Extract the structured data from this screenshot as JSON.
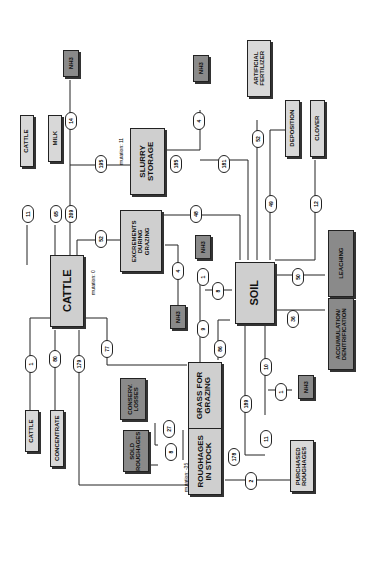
{
  "nodes": {
    "cattle_in": "CATTLE",
    "concentrate": "CONCENTRATE",
    "cattle_main": "CATTLE",
    "cattle_out": "CATTLE",
    "milk": "MILK",
    "nh3_a": "NH3",
    "slurry": "SLURRY\nSTORAGE",
    "nh3_b": "NH3",
    "artificial": "ARTIFICIAL\nFERTILIZER",
    "deposition": "DEPOSITION",
    "clover": "CLOVER",
    "excrements": "EXCREMENTS\nDURING\nGRAZING",
    "nh3_c": "NH3",
    "nh3_d": "NH3",
    "soil": "SOIL",
    "leaching": "LEACHING",
    "accum": "ACCUMULATION/\nDENITRIFICATION",
    "grass": "GRASS FOR\nGRAZING",
    "roughages": "ROUGHAGES\nIN STOCK",
    "conserv": "CONSERV.\nLOSSES",
    "sold": "SOLD\nROUGHAGES",
    "purchased": "PURCHASED\nROUGHAGES",
    "nh3_e": "NH3"
  },
  "flows": {
    "f1": "1",
    "f80": "80",
    "f179": "179",
    "f77": "77",
    "f11": "11",
    "f65": "65",
    "f209": "209",
    "f14": "14",
    "f195": "195",
    "f52": "52",
    "f185": "185",
    "f4a": "4",
    "f181": "181",
    "f52b": "52",
    "f48": "48",
    "f49": "49",
    "f12": "12",
    "f4b": "4",
    "f1b": "1",
    "f8": "8",
    "f9": "9",
    "f86": "86",
    "f50": "50",
    "f36": "36",
    "f10": "10",
    "f1c": "1",
    "f189": "189",
    "f11b": "11",
    "f178": "178",
    "f27": "27",
    "f8b": "8",
    "f2": "2"
  },
  "labels": {
    "mut_cattle": "mutation: 0",
    "mut_slurry": "mutation: 11",
    "mut_rough": "mutation: -35"
  }
}
